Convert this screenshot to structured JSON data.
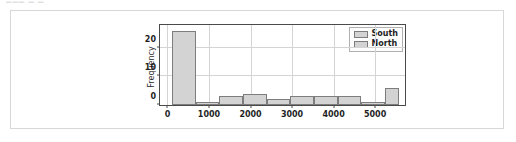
{
  "top_sliver": {
    "text": "▁▁▁ ▁ ▁"
  },
  "figure": {
    "ylabel": "Frequency",
    "legend": {
      "entries": [
        {
          "label": "South",
          "swatch_name": "legend-swatch-south"
        },
        {
          "label": "North",
          "swatch_name": "legend-swatch-north"
        }
      ]
    }
  },
  "chart_data": {
    "type": "bar",
    "title": "",
    "xlabel": "",
    "ylabel": "Frequency",
    "xlim": [
      -180,
      5720
    ],
    "ylim": [
      0,
      28
    ],
    "grid": true,
    "legend_position": "upper right",
    "xticks": [
      0,
      1000,
      2000,
      3000,
      4000,
      5000
    ],
    "xtick_labels": [
      "0",
      "1000",
      "2000",
      "3000",
      "4000",
      "5000"
    ],
    "yticks": [
      0,
      10,
      20
    ],
    "ytick_labels": [
      "0",
      "10",
      "20"
    ],
    "bin_width": 570,
    "bin_edges": [
      110,
      680,
      1250,
      1820,
      2390,
      2960,
      3530,
      4100,
      4670,
      5240,
      5580
    ],
    "bin_centers": [
      395,
      965,
      1535,
      2105,
      2675,
      3245,
      3815,
      4385,
      4955,
      5410
    ],
    "categories": [
      "395",
      "965",
      "1535",
      "2105",
      "2675",
      "3245",
      "3815",
      "4385",
      "4955",
      "5410"
    ],
    "values": [
      26,
      1,
      3,
      4,
      2,
      3,
      3,
      3,
      1,
      6
    ],
    "series": [
      {
        "name": "South",
        "categories": [
          "395",
          "965",
          "1535",
          "2105",
          "2675",
          "3245",
          "3815",
          "4385",
          "4955",
          "5410"
        ],
        "values": [
          26,
          1,
          3,
          4,
          2,
          3,
          3,
          3,
          1,
          6
        ]
      }
    ],
    "colors": {
      "bar_fill": "#d3d3d3",
      "bar_edge": "#7d7d7d",
      "grid": "#d4d4d4",
      "axis": "#4a4a4a",
      "text": "#1f1f1f",
      "card_border": "#d8d8d8",
      "background": "#ffffff"
    }
  }
}
